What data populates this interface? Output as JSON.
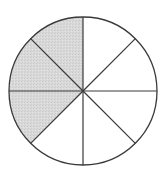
{
  "diagram": {
    "type": "fraction-circle",
    "total_sectors": 8,
    "shaded_sectors": 3,
    "fraction": "3/8",
    "shaded_indices": [
      5,
      6,
      7
    ],
    "colors": {
      "background": "#ffffff",
      "stroke": "#3a3a3a",
      "shade": "#d6d6d6"
    },
    "geometry": {
      "cx": 83,
      "cy": 91,
      "r": 74
    }
  }
}
